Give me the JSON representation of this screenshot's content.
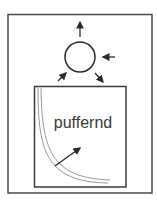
{
  "diagram": {
    "label": "puffernd",
    "colors": {
      "stroke": "#3a3a3a",
      "curve": "#8a8a8a",
      "background": "#ffffff"
    },
    "elements": {
      "outer_frame": "rectangle",
      "circle": "circle with four arrows (up-out, right-in, lower-left-in, lower-right-out)",
      "inner_box": "square containing hyperbolic curve and diagonal arrow"
    }
  }
}
